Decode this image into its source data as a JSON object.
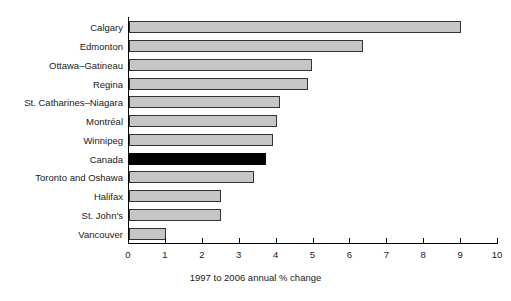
{
  "chart_data": {
    "type": "bar",
    "orientation": "horizontal",
    "title": "",
    "xlabel": "1997 to 2006 annual % change",
    "ylabel": "",
    "xlim": [
      0,
      10
    ],
    "xticks": [
      0,
      1,
      2,
      3,
      4,
      5,
      6,
      7,
      8,
      9,
      10
    ],
    "xtick_labels": [
      "0",
      "1",
      "2",
      "3",
      "4",
      "5",
      "6",
      "7",
      "8",
      "9",
      "10"
    ],
    "grid": false,
    "legend": null,
    "categories": [
      "Calgary",
      "Edmonton",
      "Ottawa–Gatineau",
      "Regina",
      "St. Catharines–Niagara",
      "Montréal",
      "Winnipeg",
      "Canada",
      "Toronto and Oshawa",
      "Halifax",
      "St. John's",
      "Vancouver"
    ],
    "values": [
      9.0,
      6.35,
      4.95,
      4.85,
      4.1,
      4.0,
      3.9,
      3.7,
      3.4,
      2.5,
      2.5,
      1.0
    ],
    "highlight_category": "Canada",
    "colors": {
      "bar_fill": "#c6c6c6",
      "bar_border": "#333333",
      "highlight_fill": "#000000",
      "axis": "#000000",
      "text": "#1a1a1a",
      "background": "#ffffff"
    }
  }
}
